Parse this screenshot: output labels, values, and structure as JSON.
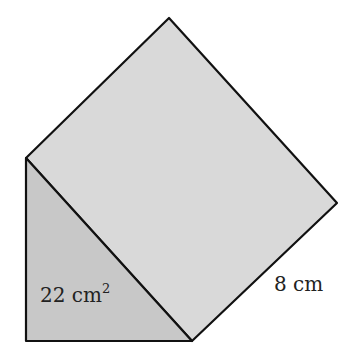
{
  "diagram": {
    "type": "triangular-prism",
    "colors": {
      "rect_face": "#d9d9d9",
      "triangle_face": "#c8c8c8",
      "stroke": "#111111",
      "background": "#ffffff"
    },
    "labels": {
      "area": "22 cm",
      "area_exp": "2",
      "length": "8 cm"
    }
  }
}
